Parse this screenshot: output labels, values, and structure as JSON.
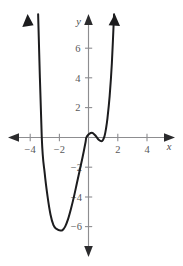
{
  "figure": {
    "kind": "cartesian-coordinate-plane",
    "background_color": "#ffffff",
    "width": 183,
    "height": 266
  },
  "axes": {
    "x_axis_label": "x",
    "y_axis_label": "y",
    "axis_color": "#8d8d90",
    "label_color": "#58585a",
    "arrow_color": "#2b2b2d",
    "x_ticks": [
      {
        "label": "−4",
        "value": -4
      },
      {
        "label": "−2",
        "value": -2
      },
      {
        "label": "2",
        "value": 2
      },
      {
        "label": "4",
        "value": 4
      }
    ],
    "y_ticks": [
      {
        "label": "6",
        "value": 6
      },
      {
        "label": "4",
        "value": 4
      },
      {
        "label": "2",
        "value": 2
      },
      {
        "label": "−2",
        "value": -2
      },
      {
        "label": "−4",
        "value": -4
      },
      {
        "label": "−6",
        "value": -6
      }
    ]
  },
  "chart_data": {
    "type": "line",
    "title": "",
    "subtitle": "",
    "xlabel": "x",
    "ylabel": "y",
    "xlim": [
      -5.5,
      5.9
    ],
    "ylim": [
      -8.0,
      8.3
    ],
    "grid": false,
    "legend": null,
    "curve_color": "#1c1c1e",
    "series": [
      {
        "name": "quartic curve",
        "x": [
          -3.45,
          -3.2,
          -3.0,
          -2.8,
          -2.6,
          -2.4,
          -2.2,
          -2.0,
          -1.8,
          -1.6,
          -1.4,
          -1.2,
          -1.0,
          -0.8,
          -0.6,
          -0.4,
          -0.2,
          -0.15,
          0.0,
          0.15,
          0.3,
          0.5,
          0.7,
          0.9,
          1.0,
          1.1,
          1.2,
          1.3,
          1.45,
          1.6,
          1.75
        ],
        "y": [
          8.3,
          0.0,
          -2.4,
          -4.0,
          -5.2,
          -5.9,
          -6.15,
          -6.25,
          -6.25,
          -6.0,
          -5.5,
          -4.8,
          -4.0,
          -3.1,
          -2.2,
          -1.3,
          -0.3,
          0.0,
          0.2,
          0.3,
          0.3,
          0.1,
          -0.15,
          -0.25,
          -0.15,
          0.1,
          0.6,
          1.3,
          2.8,
          5.0,
          8.3
        ]
      }
    ],
    "features": {
      "x_intercepts": [
        -3.2,
        -0.15,
        1.05
      ],
      "global_minimum": {
        "x": -1.8,
        "y": -6.25
      },
      "local_maximum": {
        "x": 0.3,
        "y": 0.3
      },
      "local_minimum": {
        "x": 0.9,
        "y": -0.25
      },
      "end_behavior_left": "rises to +infinity",
      "end_behavior_right": "rises to +infinity"
    }
  }
}
